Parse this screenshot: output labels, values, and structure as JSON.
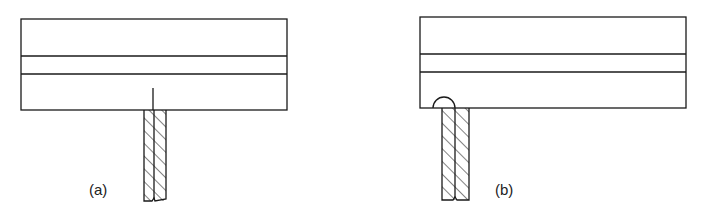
{
  "figure": {
    "panels": [
      {
        "id": "a",
        "label": "(a)",
        "description": "Layered plate with a thin vertical slit/crack above a hatched strip joined flush at the bottom edge"
      },
      {
        "id": "b",
        "label": "(b)",
        "description": "Layered plate with a semicircular notch at the bottom-left corner above a hatched strip"
      }
    ],
    "colors": {
      "line": "#1a1a1a",
      "background": "#ffffff"
    }
  }
}
